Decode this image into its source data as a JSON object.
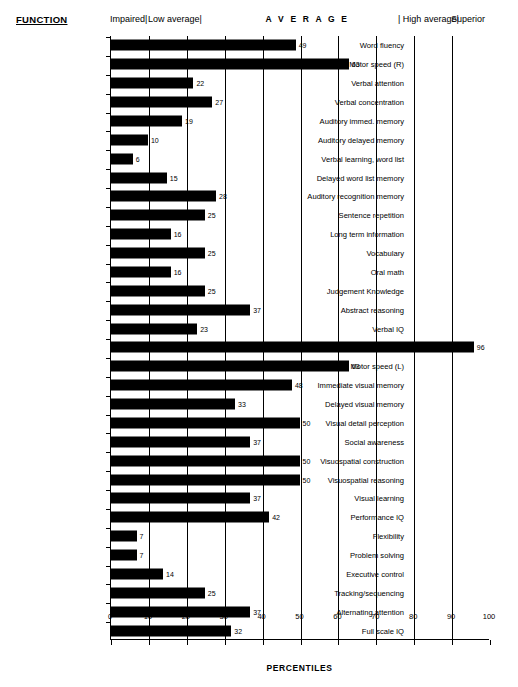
{
  "header": {
    "function_label": "FUNCTION",
    "bands": [
      {
        "label": "Impaired|",
        "x_percent": 0
      },
      {
        "label": "Low average|",
        "x_percent": 10
      },
      {
        "label": "A V E R A G E",
        "x_percent": 41,
        "spaced": true
      },
      {
        "label": "| High average|",
        "x_percent": 76
      },
      {
        "label": "Superior",
        "x_percent": 90
      }
    ]
  },
  "axis": {
    "title": "PERCENTILES",
    "ticks": [
      0,
      10,
      20,
      30,
      40,
      50,
      60,
      70,
      80,
      90,
      100
    ],
    "min": 0,
    "max": 100
  },
  "chart_data": {
    "type": "bar",
    "orientation": "horizontal",
    "title": "",
    "xlabel": "PERCENTILES",
    "ylabel": "FUNCTION",
    "xlim": [
      0,
      100
    ],
    "grid": true,
    "legend": "none",
    "bar_color": "#000000",
    "categories": [
      "Word fluency",
      "Motor speed (R)",
      "Verbal attention",
      "Verbal concentration",
      "Auditory immed. memory",
      "Auditory delayed memory",
      "Verbal learning, word list",
      "Delayed word list memory",
      "Auditory recognition memory",
      "Sentence repetition",
      "Long term information",
      "Vocabulary",
      "Oral math",
      "Judgement Knowledge",
      "Abstract reasoning",
      "Verbal IQ",
      "Planning & foresight",
      "Motor speed (L)",
      "Immediate visual memory",
      "Delayed visual memory",
      "Visual detail perception",
      "Social awareness",
      "Visuospatial construction",
      "Visuospatial reasoning",
      "Visual learning",
      "Performance IQ",
      "Flexibility",
      "Problem solving",
      "Executive control",
      "Tracking/sequencing",
      "Alternating attention",
      "Full scale IQ"
    ],
    "values": [
      49,
      63,
      22,
      27,
      19,
      10,
      6,
      15,
      28,
      25,
      16,
      25,
      16,
      25,
      37,
      23,
      96,
      63,
      48,
      33,
      50,
      37,
      50,
      50,
      37,
      42,
      7,
      7,
      14,
      25,
      37,
      32
    ],
    "annotations": [
      "49",
      "63",
      "22",
      "27",
      "19",
      "10",
      "6",
      "15",
      "28",
      "25",
      "16",
      "25",
      "16",
      "25",
      "37",
      "23",
      "96",
      "63",
      "48",
      "33",
      "50",
      "37",
      "50",
      "50",
      "37",
      "42",
      "7",
      "7",
      "14",
      "25",
      "37",
      "32"
    ]
  }
}
